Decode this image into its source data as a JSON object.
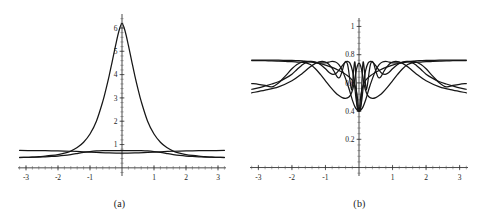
{
  "figure": {
    "background_color": "#ffffff",
    "curve_color": "#161616",
    "axis_color": "#2b2b2b",
    "panels": [
      {
        "id": "a",
        "caption": "(a)",
        "chart_ref": 0
      },
      {
        "id": "b",
        "caption": "(b)",
        "chart_ref": 1
      }
    ]
  },
  "chart_data": [
    {
      "type": "line",
      "panel": "(a)",
      "title": "",
      "xlabel": "",
      "ylabel": "",
      "xlim": [
        -3.25,
        3.25
      ],
      "ylim": [
        -0.35,
        6.6
      ],
      "grid": false,
      "legend": "none",
      "xticks": [
        -3,
        -2,
        -1,
        1,
        2,
        3
      ],
      "xtick_labels": [
        "-3",
        "-2",
        "-1",
        "1",
        "2",
        "3"
      ],
      "yticks": [
        1,
        2,
        3,
        4,
        5,
        6
      ],
      "ytick_labels": [
        "1",
        "2",
        "3",
        "4",
        "5",
        "6"
      ],
      "x_minor_tick_step": 0.2,
      "y_minor_tick_step": 0.2,
      "series": [
        {
          "name": "peak",
          "description": "tall symmetric peak centered at x=0 reaching about 6.2",
          "x": [
            -3.2,
            -3.0,
            -2.8,
            -2.6,
            -2.4,
            -2.2,
            -2.0,
            -1.8,
            -1.6,
            -1.4,
            -1.2,
            -1.0,
            -0.8,
            -0.6,
            -0.5,
            -0.4,
            -0.3,
            -0.2,
            -0.1,
            0.0,
            0.1,
            0.2,
            0.3,
            0.4,
            0.5,
            0.6,
            0.8,
            1.0,
            1.2,
            1.4,
            1.6,
            1.8,
            2.0,
            2.2,
            2.4,
            2.6,
            2.8,
            3.0,
            3.2
          ],
          "y": [
            0.44,
            0.45,
            0.46,
            0.48,
            0.5,
            0.53,
            0.57,
            0.63,
            0.72,
            0.87,
            1.1,
            1.45,
            2.0,
            2.85,
            3.38,
            3.96,
            4.6,
            5.25,
            5.85,
            6.2,
            5.85,
            5.25,
            4.6,
            3.96,
            3.38,
            2.85,
            2.0,
            1.45,
            1.1,
            0.87,
            0.72,
            0.63,
            0.57,
            0.53,
            0.5,
            0.48,
            0.46,
            0.45,
            0.44
          ]
        },
        {
          "name": "flat-upper",
          "description": "nearly horizontal curve around 0.72 dipping slightly near center to 0.62",
          "x": [
            -3.2,
            -2.8,
            -2.4,
            -2.0,
            -1.6,
            -1.2,
            -0.8,
            -0.4,
            0.0,
            0.4,
            0.8,
            1.2,
            1.6,
            2.0,
            2.4,
            2.8,
            3.2
          ],
          "y": [
            0.745,
            0.742,
            0.736,
            0.726,
            0.712,
            0.69,
            0.665,
            0.64,
            0.63,
            0.64,
            0.665,
            0.69,
            0.712,
            0.726,
            0.736,
            0.742,
            0.745
          ]
        },
        {
          "name": "shallow-bump",
          "description": "low curve near 0.44 at edges bulging to about 0.72 near center",
          "x": [
            -3.2,
            -3.0,
            -2.8,
            -2.6,
            -2.4,
            -2.2,
            -2.0,
            -1.8,
            -1.6,
            -1.4,
            -1.2,
            -1.0,
            -0.8,
            -0.6,
            -0.4,
            -0.2,
            0.0,
            0.2,
            0.4,
            0.6,
            0.8,
            1.0,
            1.2,
            1.4,
            1.6,
            1.8,
            2.0,
            2.2,
            2.4,
            2.6,
            2.8,
            3.0,
            3.2
          ],
          "y": [
            0.45,
            0.452,
            0.456,
            0.463,
            0.473,
            0.487,
            0.507,
            0.535,
            0.572,
            0.615,
            0.66,
            0.698,
            0.723,
            0.735,
            0.74,
            0.742,
            0.742,
            0.742,
            0.74,
            0.735,
            0.723,
            0.698,
            0.66,
            0.615,
            0.572,
            0.535,
            0.507,
            0.487,
            0.473,
            0.463,
            0.456,
            0.452,
            0.45
          ]
        }
      ]
    },
    {
      "type": "line",
      "panel": "(b)",
      "title": "",
      "xlabel": "",
      "ylabel": "",
      "xlim": [
        -3.25,
        3.25
      ],
      "ylim": [
        -0.06,
        1.06
      ],
      "grid": false,
      "legend": "none",
      "xticks": [
        -3,
        -2,
        -1,
        1,
        2,
        3
      ],
      "xtick_labels": [
        "-3",
        "-2",
        "-1",
        "1",
        "2",
        "3"
      ],
      "yticks": [
        0.2,
        0.4,
        0.6,
        0.8,
        1
      ],
      "ytick_labels": [
        "0.2",
        "0.4",
        "0.6",
        "0.8",
        "1"
      ],
      "x_minor_tick_step": 0.2,
      "y_minor_tick_step": 0.04,
      "series": [
        {
          "name": "envelope-upper",
          "description": "flat near 0.76 at edges, dips toward 0.40 at the origin",
          "x": [
            -3.2,
            -2.8,
            -2.4,
            -2.0,
            -1.8,
            -1.6,
            -1.4,
            -1.2,
            -1.0,
            -0.8,
            -0.6,
            -0.45,
            -0.35,
            -0.25,
            -0.18,
            -0.12,
            -0.06,
            0.0,
            0.06,
            0.12,
            0.18,
            0.25,
            0.35,
            0.45,
            0.6,
            0.8,
            1.0,
            1.2,
            1.4,
            1.6,
            1.8,
            2.0,
            2.4,
            2.8,
            3.2
          ],
          "y": [
            0.762,
            0.762,
            0.761,
            0.759,
            0.757,
            0.753,
            0.747,
            0.738,
            0.726,
            0.71,
            0.688,
            0.668,
            0.652,
            0.632,
            0.612,
            0.58,
            0.52,
            0.4,
            0.52,
            0.58,
            0.612,
            0.632,
            0.652,
            0.668,
            0.688,
            0.71,
            0.726,
            0.738,
            0.747,
            0.753,
            0.757,
            0.759,
            0.761,
            0.762,
            0.762
          ]
        },
        {
          "name": "lobe-1",
          "description": "wide lobe peaking near x=+-0.8 and crossing the flat band at x=+-1.65",
          "x": [
            -3.2,
            -3.0,
            -2.8,
            -2.6,
            -2.4,
            -2.2,
            -2.0,
            -1.85,
            -1.7,
            -1.6,
            -1.5,
            -1.35,
            -1.2,
            -1.05,
            -0.9,
            -0.8,
            -0.7,
            -0.6,
            -0.5,
            -0.4,
            -0.3,
            -0.2,
            -0.12,
            -0.06,
            0.0,
            0.06,
            0.12,
            0.2,
            0.3,
            0.4,
            0.5,
            0.6,
            0.7,
            0.8,
            0.9,
            1.05,
            1.2,
            1.35,
            1.5,
            1.6,
            1.7,
            1.85,
            2.0,
            2.2,
            2.4,
            2.6,
            2.8,
            3.0,
            3.2
          ],
          "y": [
            0.595,
            0.59,
            0.582,
            0.572,
            0.6,
            0.648,
            0.7,
            0.73,
            0.748,
            0.752,
            0.752,
            0.748,
            0.742,
            0.742,
            0.748,
            0.752,
            0.748,
            0.73,
            0.69,
            0.63,
            0.56,
            0.48,
            0.43,
            0.41,
            0.4,
            0.41,
            0.43,
            0.48,
            0.56,
            0.63,
            0.69,
            0.73,
            0.748,
            0.752,
            0.748,
            0.742,
            0.742,
            0.748,
            0.752,
            0.752,
            0.748,
            0.73,
            0.7,
            0.648,
            0.6,
            0.572,
            0.582,
            0.59,
            0.595
          ]
        },
        {
          "name": "lobe-2",
          "description": "descending arc from the flat band near the edges down through the crossing to the origin basin",
          "x": [
            -3.2,
            -3.0,
            -2.8,
            -2.6,
            -2.4,
            -2.2,
            -2.0,
            -1.85,
            -1.7,
            -1.6,
            -1.45,
            -1.3,
            -1.15,
            -1.0,
            -0.85,
            -0.7,
            -0.6,
            -0.5,
            -0.4,
            -0.3,
            -0.22,
            -0.15,
            -0.1,
            -0.05,
            0.0,
            0.05,
            0.1,
            0.15,
            0.22,
            0.3,
            0.4,
            0.5,
            0.6,
            0.7,
            0.85,
            1.0,
            1.15,
            1.3,
            1.45,
            1.6,
            1.7,
            1.85,
            2.0,
            2.2,
            2.4,
            2.6,
            2.8,
            3.0,
            3.2
          ],
          "y": [
            0.758,
            0.758,
            0.757,
            0.756,
            0.754,
            0.752,
            0.75,
            0.748,
            0.746,
            0.744,
            0.73,
            0.7,
            0.66,
            0.615,
            0.57,
            0.53,
            0.51,
            0.496,
            0.49,
            0.5,
            0.53,
            0.59,
            0.665,
            0.72,
            0.74,
            0.72,
            0.665,
            0.59,
            0.53,
            0.5,
            0.49,
            0.496,
            0.51,
            0.53,
            0.57,
            0.615,
            0.66,
            0.7,
            0.73,
            0.744,
            0.746,
            0.748,
            0.75,
            0.752,
            0.754,
            0.756,
            0.757,
            0.758,
            0.758
          ]
        },
        {
          "name": "lobe-3",
          "description": "lower undulating curve rising from 0.55 at the edges, crossing near x=+-1.65",
          "x": [
            -3.2,
            -3.0,
            -2.8,
            -2.6,
            -2.4,
            -2.2,
            -2.0,
            -1.85,
            -1.72,
            -1.6,
            -1.45,
            -1.3,
            -1.15,
            -1.0,
            -0.88,
            -0.78,
            -0.68,
            -0.58,
            -0.5,
            -0.42,
            -0.34,
            -0.27,
            -0.2,
            -0.14,
            -0.09,
            -0.05,
            0.0,
            0.05,
            0.09,
            0.14,
            0.2,
            0.27,
            0.34,
            0.42,
            0.5,
            0.58,
            0.68,
            0.78,
            0.88,
            1.0,
            1.15,
            1.3,
            1.45,
            1.6,
            1.72,
            1.85,
            2.0,
            2.2,
            2.4,
            2.6,
            2.8,
            3.0,
            3.2
          ],
          "y": [
            0.555,
            0.565,
            0.578,
            0.592,
            0.608,
            0.632,
            0.662,
            0.695,
            0.722,
            0.742,
            0.752,
            0.748,
            0.73,
            0.7,
            0.672,
            0.66,
            0.668,
            0.695,
            0.722,
            0.745,
            0.752,
            0.74,
            0.69,
            0.6,
            0.49,
            0.43,
            0.4,
            0.43,
            0.49,
            0.6,
            0.69,
            0.74,
            0.752,
            0.745,
            0.722,
            0.695,
            0.668,
            0.66,
            0.672,
            0.7,
            0.73,
            0.748,
            0.752,
            0.742,
            0.722,
            0.695,
            0.662,
            0.632,
            0.608,
            0.592,
            0.578,
            0.565,
            0.555
          ]
        },
        {
          "name": "lobe-4",
          "description": "fast oscillating curve confined near the centre producing the dense ripples",
          "x": [
            -3.2,
            -2.8,
            -2.4,
            -2.0,
            -1.7,
            -1.5,
            -1.3,
            -1.1,
            -0.95,
            -0.82,
            -0.72,
            -0.64,
            -0.57,
            -0.5,
            -0.44,
            -0.39,
            -0.34,
            -0.3,
            -0.26,
            -0.22,
            -0.19,
            -0.16,
            -0.13,
            -0.11,
            -0.09,
            -0.07,
            -0.05,
            -0.03,
            0.0,
            0.03,
            0.05,
            0.07,
            0.09,
            0.11,
            0.13,
            0.16,
            0.19,
            0.22,
            0.26,
            0.3,
            0.34,
            0.39,
            0.44,
            0.5,
            0.57,
            0.64,
            0.72,
            0.82,
            0.95,
            1.1,
            1.3,
            1.5,
            1.7,
            2.0,
            2.4,
            2.8,
            3.2
          ],
          "y": [
            0.53,
            0.548,
            0.572,
            0.615,
            0.665,
            0.705,
            0.738,
            0.752,
            0.742,
            0.71,
            0.672,
            0.64,
            0.64,
            0.685,
            0.735,
            0.752,
            0.73,
            0.672,
            0.6,
            0.55,
            0.6,
            0.69,
            0.748,
            0.72,
            0.62,
            0.49,
            0.43,
            0.4,
            0.4,
            0.4,
            0.43,
            0.49,
            0.62,
            0.72,
            0.748,
            0.69,
            0.6,
            0.55,
            0.6,
            0.672,
            0.73,
            0.752,
            0.735,
            0.685,
            0.64,
            0.64,
            0.672,
            0.71,
            0.742,
            0.752,
            0.738,
            0.705,
            0.665,
            0.615,
            0.572,
            0.548,
            0.53
          ]
        }
      ]
    }
  ]
}
